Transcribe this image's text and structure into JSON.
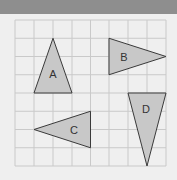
{
  "header": {
    "color": "#8e8e8e"
  },
  "grid": {
    "columns": 8,
    "rows": 8,
    "line_color": "#c9c9c9",
    "background": "#efefef"
  },
  "shapes": [
    {
      "label": "A",
      "points_grid": [
        [
          2,
          1
        ],
        [
          1,
          4
        ],
        [
          3,
          4
        ]
      ]
    },
    {
      "label": "B",
      "points_grid": [
        [
          5,
          1
        ],
        [
          5,
          3
        ],
        [
          8,
          2
        ]
      ]
    },
    {
      "label": "C",
      "points_grid": [
        [
          4,
          5
        ],
        [
          4,
          7
        ],
        [
          1,
          6
        ]
      ]
    },
    {
      "label": "D",
      "points_grid": [
        [
          6,
          4
        ],
        [
          8,
          4
        ],
        [
          7,
          8
        ]
      ]
    }
  ],
  "style": {
    "fill": "#c8c8c8",
    "stroke": "#3a3a3a"
  }
}
